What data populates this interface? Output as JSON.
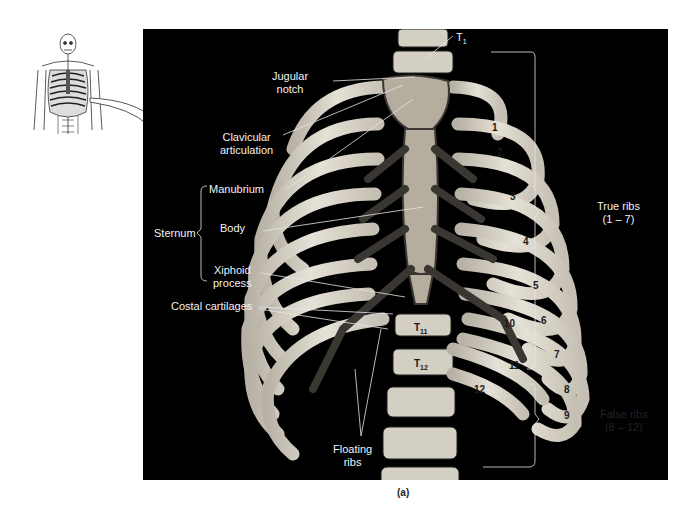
{
  "figure": {
    "caption": "(a)",
    "thumbnail": {
      "name": "skeleton-thumbnail",
      "arrow": "pointer-arrow"
    },
    "labels": {
      "t1": "T",
      "t1_sub": "1",
      "jugular_notch": [
        "Jugular",
        "notch"
      ],
      "clavicular_articulation": [
        "Clavicular",
        "articulation"
      ],
      "manubrium": "Manubrium",
      "sternum": "Sternum",
      "body": "Body",
      "xiphoid_process": [
        "Xiphoid",
        "process"
      ],
      "costal_cartilages": "Costal cartilages",
      "floating_ribs": [
        "Floating",
        "ribs"
      ],
      "true_ribs": [
        "True ribs",
        "(1 – 7)"
      ],
      "false_ribs": [
        "False ribs",
        "(8 – 12)"
      ]
    },
    "rib_numbers": [
      "1",
      "2",
      "3",
      "4",
      "5",
      "6",
      "7",
      "8",
      "9",
      "10",
      "11",
      "12"
    ],
    "vertebrae": {
      "t11": "T",
      "t11_sub": "11",
      "t12": "T",
      "t12_sub": "12"
    },
    "colors": {
      "background": "#000000",
      "bone": "#d9d4c8",
      "cartilage": "#3a3733",
      "label_text": "#f2f2f2",
      "leader_line": "#e6e6e6"
    }
  }
}
